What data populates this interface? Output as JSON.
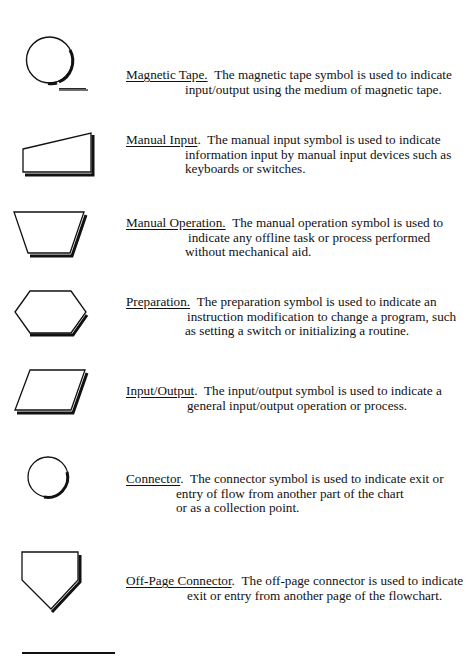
{
  "document": {
    "type": "flowchart symbol reference",
    "entries": [
      {
        "term": "Magnetic Tape.",
        "symbol": "magnetic-tape-icon",
        "lines": [
          "The magnetic tape symbol is used to indicate",
          "input/output using the medium of magnetic tape."
        ]
      },
      {
        "term": "Manual Input",
        "term_suffix": ".",
        "symbol": "manual-input-icon",
        "lines": [
          "The manual input symbol is used to indicate",
          "information input by manual input devices such as",
          "keyboards or switches."
        ]
      },
      {
        "term": "Manual Operation.",
        "symbol": "manual-operation-icon",
        "lines": [
          "The manual operation symbol is used to",
          "indicate any offline task or process performed",
          "without mechanical aid."
        ]
      },
      {
        "term": "Preparation.",
        "symbol": "preparation-icon",
        "lines": [
          "The preparation symbol is used to indicate an",
          "instruction modification to change a program, such",
          "as setting a switch or initializing a routine."
        ]
      },
      {
        "term": "Input/Output",
        "term_suffix": ".",
        "symbol": "input-output-icon",
        "lines": [
          "The input/output symbol is used to indicate a",
          "general input/output operation or process."
        ]
      },
      {
        "term": "Connector",
        "term_suffix": ".",
        "symbol": "connector-icon",
        "lines": [
          "The connector symbol is used to indicate exit or",
          "entry of flow from another part of the chart",
          "or as a collection point."
        ]
      },
      {
        "term": "Off-Page Connector",
        "term_suffix": ".",
        "symbol": "off-page-connector-icon",
        "lines": [
          "The off-page connector is used to indicate",
          "exit or entry from another page of the flowchart."
        ]
      }
    ]
  },
  "colors": {
    "ink": "#111111",
    "background": "#ffffff"
  }
}
